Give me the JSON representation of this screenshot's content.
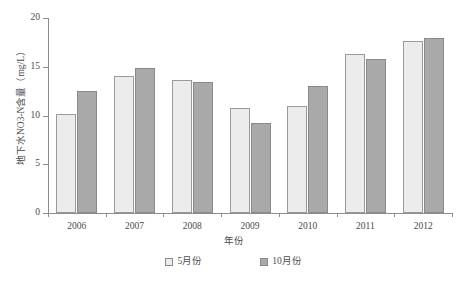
{
  "chart_data": {
    "type": "bar",
    "title": "",
    "xlabel": "年份",
    "ylabel": "地下水NO3-N含量（mg/L）",
    "categories": [
      "2006",
      "2007",
      "2008",
      "2009",
      "2010",
      "2011",
      "2012"
    ],
    "series": [
      {
        "name": "5月份",
        "color": "#ececec",
        "values": [
          10.2,
          14.1,
          13.6,
          10.8,
          11.0,
          16.3,
          17.6
        ]
      },
      {
        "name": "10月份",
        "color": "#a9a9a9",
        "values": [
          12.5,
          14.9,
          13.4,
          9.2,
          13.0,
          15.8,
          18.0
        ]
      }
    ],
    "ylim": [
      0,
      20
    ],
    "yticks": [
      "0",
      "5",
      "10",
      "15",
      "20"
    ],
    "ytick_values": [
      0,
      5,
      10,
      15,
      20
    ],
    "grid": false,
    "legend_position": "bottom"
  },
  "axis": {
    "y_title": "地下水NO3-N含量（mg/L）",
    "x_title": "年份"
  },
  "legend": {
    "items": [
      {
        "label": "5月份",
        "swatch": "light-gray-swatch"
      },
      {
        "label": "10月份",
        "swatch": "dark-gray-swatch"
      }
    ]
  }
}
